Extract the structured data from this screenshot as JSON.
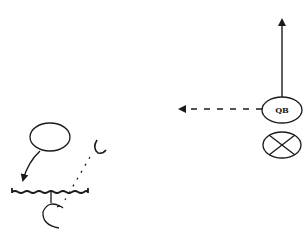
{
  "diagram": {
    "type": "football-play",
    "background": "#ffffff",
    "stroke_color": "#1a1a1a",
    "players": [
      {
        "id": "qb",
        "label": "QB",
        "shape": "ellipse",
        "cx": 282,
        "cy": 110
      },
      {
        "id": "center-x",
        "label": "",
        "shape": "crossed-ellipse",
        "cx": 282,
        "cy": 145
      },
      {
        "id": "receiver",
        "label": "",
        "shape": "ellipse",
        "cx": 50,
        "cy": 137
      }
    ],
    "routes": [
      {
        "id": "qb-vertical",
        "style": "solid",
        "from": [
          282,
          97
        ],
        "to": [
          282,
          17
        ]
      },
      {
        "id": "qb-pitch",
        "style": "dashed",
        "from": [
          262,
          109
        ],
        "to": [
          177,
          109
        ]
      },
      {
        "id": "receiver-block",
        "style": "solid",
        "from": [
          40,
          152
        ],
        "to": [
          22,
          182
        ]
      },
      {
        "id": "defender-drop",
        "style": "dotted",
        "from": [
          92,
          155
        ],
        "to": [
          64,
          200
        ]
      }
    ],
    "markers": [
      {
        "id": "block-line",
        "shape": "squiggle-bracket"
      },
      {
        "id": "defender-c",
        "shape": "C"
      },
      {
        "id": "defender-hook",
        "shape": "hook"
      }
    ]
  }
}
